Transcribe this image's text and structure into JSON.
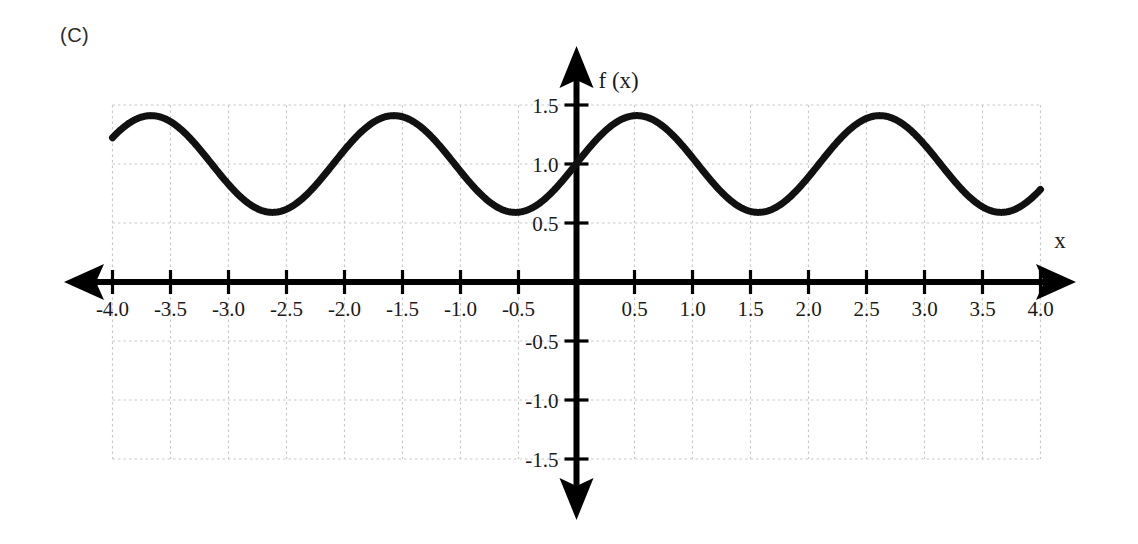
{
  "panel": {
    "label": "(C)"
  },
  "chart_data": {
    "type": "line",
    "title": "",
    "subtitle": "",
    "xlabel": "x",
    "ylabel": "f (x)",
    "xlim": [
      -4.0,
      4.0
    ],
    "ylim": [
      -1.5,
      1.5
    ],
    "grid": true,
    "grid_step_x": 0.5,
    "grid_step_y": 0.5,
    "grid_color": "#c9c9c9",
    "axis_color": "#000000",
    "curve_color": "#111111",
    "curve_width": 7,
    "legend": "none",
    "xticks": [
      -4.0,
      -3.5,
      -3.0,
      -2.5,
      -2.0,
      -1.5,
      -1.0,
      -0.5,
      0.5,
      1.0,
      1.5,
      2.0,
      2.5,
      3.0,
      3.5,
      4.0
    ],
    "xtick_labels": [
      "-4.0",
      "-3.5",
      "-3.0",
      "-2.5",
      "-2.0",
      "-1.5",
      "-1.0",
      "-0.5",
      "0.5",
      "1.0",
      "1.5",
      "2.0",
      "2.5",
      "3.0",
      "3.5",
      "4.0"
    ],
    "yticks": [
      1.5,
      1.0,
      0.5,
      -0.5,
      -1.0,
      -1.5
    ],
    "ytick_labels": [
      "1.5",
      "1.0",
      "0.5",
      "-0.5",
      "-1.0",
      "-1.5"
    ],
    "function": "f(x) = 1 + 0.41*cos(3*(x - 0.52))",
    "midline": 1.0,
    "amplitude": 0.41,
    "period": 2.094,
    "phase_peak_x": 0.52,
    "maxima_x": [
      -3.45,
      -1.36,
      0.52,
      2.61
    ],
    "maxima_y": [
      1.41,
      1.41,
      1.41,
      1.41
    ],
    "minima_x": [
      -2.57,
      -0.52,
      1.57,
      3.66
    ],
    "minima_y": [
      0.59,
      0.59,
      0.59,
      0.59
    ],
    "x": [
      -4.0,
      -3.8,
      -3.6,
      -3.4,
      -3.2,
      -3.0,
      -2.8,
      -2.6,
      -2.4,
      -2.2,
      -2.0,
      -1.8,
      -1.6,
      -1.4,
      -1.2,
      -1.0,
      -0.8,
      -0.6,
      -0.4,
      -0.2,
      0.0,
      0.2,
      0.4,
      0.6,
      0.8,
      1.0,
      1.2,
      1.4,
      1.6,
      1.8,
      2.0,
      2.2,
      2.4,
      2.6,
      2.8,
      3.0,
      3.2,
      3.4,
      3.6,
      3.8,
      4.0
    ],
    "y": [
      1.28,
      1.38,
      1.41,
      1.41,
      1.35,
      1.22,
      1.02,
      0.81,
      0.66,
      0.59,
      0.61,
      0.73,
      0.91,
      1.13,
      1.31,
      1.4,
      1.41,
      1.32,
      1.15,
      0.95,
      0.76,
      0.64,
      0.59,
      0.63,
      0.76,
      0.95,
      1.15,
      1.32,
      1.41,
      1.4,
      1.31,
      1.13,
      0.91,
      0.73,
      0.61,
      0.59,
      0.66,
      0.81,
      1.02,
      1.22,
      1.35
    ]
  }
}
